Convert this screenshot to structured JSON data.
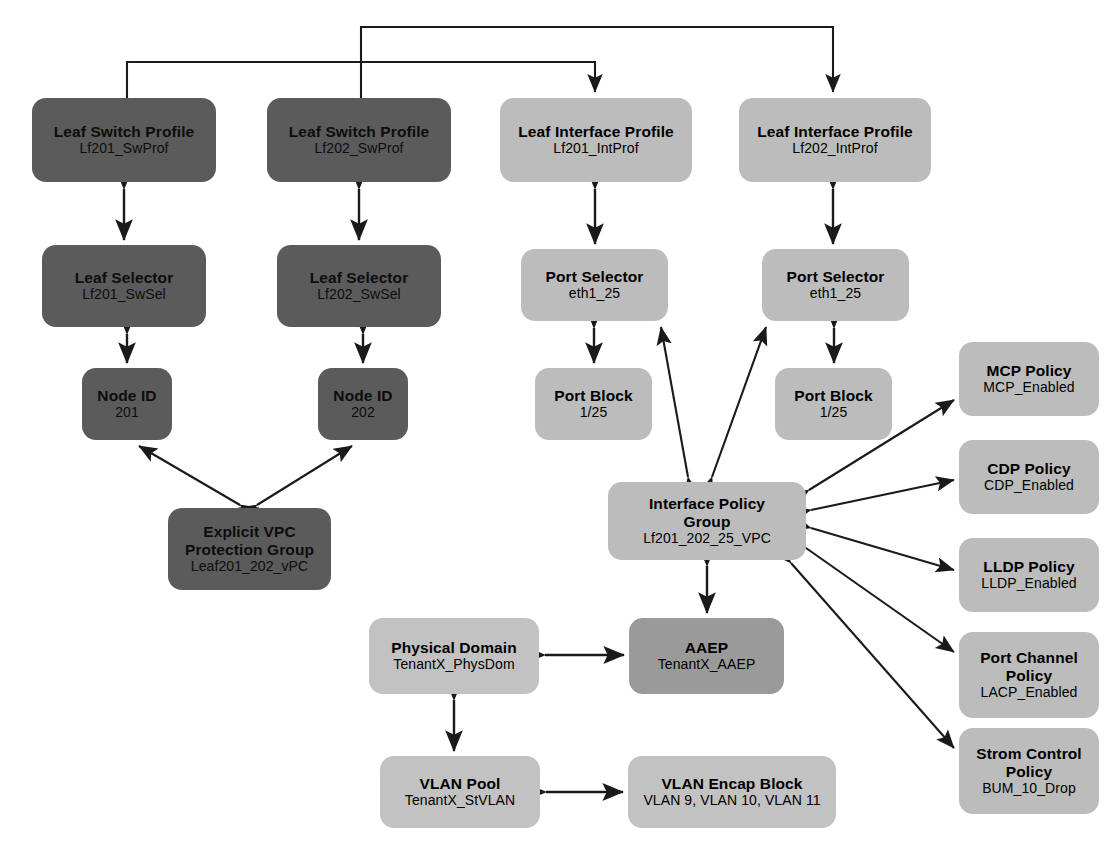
{
  "diagram": {
    "palette": {
      "dark_gray": "#5b5b5b",
      "medium_gray": "#9a9a9a",
      "light_gray": "#bcbcbc",
      "light_gray_2": "#c2c2c2",
      "line": "#1a1a1a",
      "background": "#ffffff"
    },
    "nodes": [
      {
        "id": "lf201_swprof",
        "title": "Leaf Switch Profile",
        "subtitle": "Lf201_SwProf",
        "tone": "dark",
        "x": 32,
        "y": 98,
        "w": 184,
        "h": 84
      },
      {
        "id": "lf202_swprof",
        "title": "Leaf Switch Profile",
        "subtitle": "Lf202_SwProf",
        "tone": "dark",
        "x": 267,
        "y": 98,
        "w": 184,
        "h": 84
      },
      {
        "id": "lf201_intprof",
        "title": "Leaf Interface Profile",
        "subtitle": "Lf201_IntProf",
        "tone": "light",
        "x": 500,
        "y": 98,
        "w": 192,
        "h": 84
      },
      {
        "id": "lf202_intprof",
        "title": "Leaf Interface Profile",
        "subtitle": "Lf202_IntProf",
        "tone": "light",
        "x": 739,
        "y": 98,
        "w": 192,
        "h": 84
      },
      {
        "id": "lf201_swsel",
        "title": "Leaf Selector",
        "subtitle": "Lf201_SwSel",
        "tone": "dark",
        "x": 42,
        "y": 245,
        "w": 164,
        "h": 82
      },
      {
        "id": "lf202_swsel",
        "title": "Leaf Selector",
        "subtitle": "Lf202_SwSel",
        "tone": "dark",
        "x": 277,
        "y": 245,
        "w": 164,
        "h": 82
      },
      {
        "id": "port_sel_1",
        "title": "Port Selector",
        "subtitle": "eth1_25",
        "tone": "light",
        "x": 521,
        "y": 249,
        "w": 147,
        "h": 72
      },
      {
        "id": "port_sel_2",
        "title": "Port Selector",
        "subtitle": "eth1_25",
        "tone": "light",
        "x": 762,
        "y": 249,
        "w": 147,
        "h": 72
      },
      {
        "id": "node_id_201",
        "title": "Node ID",
        "subtitle": "201",
        "tone": "dark",
        "x": 82,
        "y": 368,
        "w": 90,
        "h": 72
      },
      {
        "id": "node_id_202",
        "title": "Node ID",
        "subtitle": "202",
        "tone": "dark",
        "x": 318,
        "y": 368,
        "w": 90,
        "h": 72
      },
      {
        "id": "port_block_1",
        "title": "Port Block",
        "subtitle": "1/25",
        "tone": "light",
        "x": 535,
        "y": 368,
        "w": 117,
        "h": 72
      },
      {
        "id": "port_block_2",
        "title": "Port Block",
        "subtitle": "1/25",
        "tone": "light",
        "x": 775,
        "y": 368,
        "w": 117,
        "h": 72
      },
      {
        "id": "vpc_group",
        "title": "Explicit VPC\nProtection Group",
        "subtitle": "Leaf201_202_vPC",
        "tone": "dark",
        "x": 168,
        "y": 508,
        "w": 163,
        "h": 82
      },
      {
        "id": "ipg",
        "title": "Interface Policy\nGroup",
        "subtitle": "Lf201_202_25_VPC",
        "tone": "light",
        "x": 608,
        "y": 482,
        "w": 198,
        "h": 78
      },
      {
        "id": "mcp_policy",
        "title": "MCP Policy",
        "subtitle": "MCP_Enabled",
        "tone": "light",
        "x": 959,
        "y": 342,
        "w": 140,
        "h": 74
      },
      {
        "id": "cdp_policy",
        "title": "CDP Policy",
        "subtitle": "CDP_Enabled",
        "tone": "light",
        "x": 959,
        "y": 440,
        "w": 140,
        "h": 74
      },
      {
        "id": "lldp_policy",
        "title": "LLDP Policy",
        "subtitle": "LLDP_Enabled",
        "tone": "light",
        "x": 959,
        "y": 538,
        "w": 140,
        "h": 74
      },
      {
        "id": "pc_policy",
        "title": "Port Channel\nPolicy",
        "subtitle": "LACP_Enabled",
        "tone": "light",
        "x": 959,
        "y": 632,
        "w": 140,
        "h": 86
      },
      {
        "id": "storm_policy",
        "title": "Strom Control\nPolicy",
        "subtitle": "BUM_10_Drop",
        "tone": "light",
        "x": 959,
        "y": 728,
        "w": 140,
        "h": 86
      },
      {
        "id": "phys_dom",
        "title": "Physical Domain",
        "subtitle": "TenantX_PhysDom",
        "tone": "light2",
        "x": 369,
        "y": 618,
        "w": 170,
        "h": 76
      },
      {
        "id": "aaep",
        "title": "AAEP",
        "subtitle": "TenantX_AAEP",
        "tone": "mid",
        "x": 629,
        "y": 618,
        "w": 155,
        "h": 76
      },
      {
        "id": "vlan_pool",
        "title": "VLAN Pool",
        "subtitle": "TenantX_StVLAN",
        "tone": "light2",
        "x": 380,
        "y": 756,
        "w": 160,
        "h": 72
      },
      {
        "id": "vlan_encap",
        "title": "VLAN Encap Block",
        "subtitle": "VLAN 9, VLAN 10, VLAN 11",
        "tone": "light2",
        "x": 628,
        "y": 756,
        "w": 208,
        "h": 72
      }
    ],
    "connections": [
      {
        "from": "lf201_swprof",
        "to": "lf201_intprof",
        "kind": "bracket"
      },
      {
        "from": "lf202_swprof",
        "to": "lf202_intprof",
        "kind": "bracket"
      },
      {
        "from": "lf201_swprof",
        "to": "lf201_swsel",
        "kind": "bidirectional"
      },
      {
        "from": "lf202_swprof",
        "to": "lf202_swsel",
        "kind": "bidirectional"
      },
      {
        "from": "lf201_swsel",
        "to": "node_id_201",
        "kind": "bidirectional"
      },
      {
        "from": "lf202_swsel",
        "to": "node_id_202",
        "kind": "bidirectional"
      },
      {
        "from": "lf201_intprof",
        "to": "port_sel_1",
        "kind": "bidirectional"
      },
      {
        "from": "lf202_intprof",
        "to": "port_sel_2",
        "kind": "bidirectional"
      },
      {
        "from": "port_sel_1",
        "to": "port_block_1",
        "kind": "bidirectional"
      },
      {
        "from": "port_sel_2",
        "to": "port_block_2",
        "kind": "bidirectional"
      },
      {
        "from": "vpc_group",
        "to": "node_id_201",
        "kind": "bidirectional"
      },
      {
        "from": "vpc_group",
        "to": "node_id_202",
        "kind": "bidirectional"
      },
      {
        "from": "ipg",
        "to": "port_sel_1",
        "kind": "bidirectional"
      },
      {
        "from": "ipg",
        "to": "port_sel_2",
        "kind": "bidirectional"
      },
      {
        "from": "ipg",
        "to": "mcp_policy",
        "kind": "bidirectional"
      },
      {
        "from": "ipg",
        "to": "cdp_policy",
        "kind": "bidirectional"
      },
      {
        "from": "ipg",
        "to": "lldp_policy",
        "kind": "bidirectional"
      },
      {
        "from": "ipg",
        "to": "pc_policy",
        "kind": "bidirectional"
      },
      {
        "from": "ipg",
        "to": "storm_policy",
        "kind": "bidirectional"
      },
      {
        "from": "ipg",
        "to": "aaep",
        "kind": "bidirectional"
      },
      {
        "from": "aaep",
        "to": "phys_dom",
        "kind": "bidirectional"
      },
      {
        "from": "phys_dom",
        "to": "vlan_pool",
        "kind": "bidirectional"
      },
      {
        "from": "vlan_pool",
        "to": "vlan_encap",
        "kind": "bidirectional"
      }
    ]
  }
}
